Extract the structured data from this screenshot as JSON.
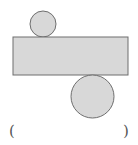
{
  "diagram": {
    "colors": {
      "fill": "#d8d8d8",
      "stroke": "#6e6e6e",
      "background": "#ffffff"
    },
    "shapes": {
      "small_circle": {
        "cx": 43,
        "cy": 24,
        "r": 13
      },
      "rectangle": {
        "x": 13,
        "y": 37,
        "width": 115,
        "height": 38
      },
      "large_circle": {
        "cx": 92.5,
        "cy": 96.5,
        "r": 21.5
      }
    },
    "answer_blank": {
      "open_paren": "(",
      "close_paren": ")"
    }
  }
}
